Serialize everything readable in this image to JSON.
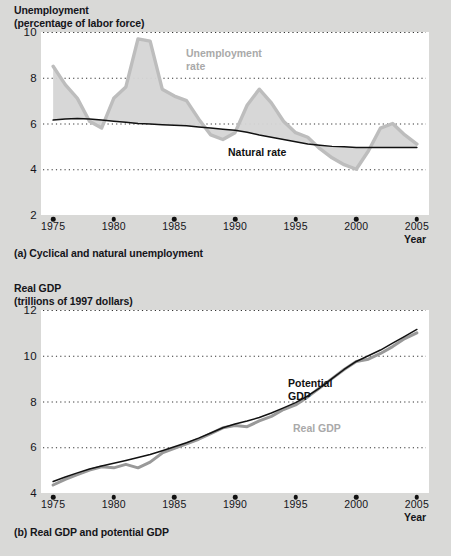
{
  "figure": {
    "background_color": "#d9d9d7",
    "plot_background_color": "#ffffff",
    "gray_series_color": "#bdbdbd",
    "black_series_color": "#111111",
    "gridline_color": "#333333"
  },
  "panel_a": {
    "axis_title_line1": "Unemployment",
    "axis_title_line2": "(percentage of labor force)",
    "caption": "(a) Cyclical and natural unemployment",
    "x_axis_label": "Year",
    "series_label_unemployment": "Unemployment\nrate",
    "series_label_natural": "Natural rate"
  },
  "panel_b": {
    "axis_title_line1": "Real GDP",
    "axis_title_line2": "(trillions of 1997 dollars)",
    "caption": "(b) Real GDP and potential GDP",
    "x_axis_label": "Year",
    "series_label_potential": "Potential\nGDP",
    "series_label_real": "Real GDP"
  },
  "chart_data": [
    {
      "type": "area",
      "panel": "a",
      "title": "Unemployment (percentage of labor force)",
      "xlabel": "Year",
      "ylabel": "Unemployment (percentage of labor force)",
      "xlim": [
        1974,
        2006
      ],
      "ylim": [
        2,
        10
      ],
      "yticks": [
        2,
        4,
        6,
        8,
        10
      ],
      "xticks": [
        1975,
        1980,
        1985,
        1990,
        1995,
        2000,
        2005
      ],
      "grid": "horizontal-dotted",
      "legend": "inline-annotations",
      "x": [
        1975,
        1976,
        1977,
        1978,
        1979,
        1980,
        1981,
        1982,
        1983,
        1984,
        1985,
        1986,
        1987,
        1988,
        1989,
        1990,
        1991,
        1992,
        1993,
        1994,
        1995,
        1996,
        1997,
        1998,
        1999,
        2000,
        2001,
        2002,
        2003,
        2004,
        2005
      ],
      "series": [
        {
          "name": "Unemployment rate",
          "color": "#bdbdbd",
          "values": [
            8.5,
            7.7,
            7.1,
            6.1,
            5.8,
            7.1,
            7.6,
            9.7,
            9.6,
            7.5,
            7.2,
            7.0,
            6.2,
            5.5,
            5.3,
            5.6,
            6.8,
            7.5,
            6.9,
            6.1,
            5.6,
            5.4,
            4.9,
            4.5,
            4.2,
            4.0,
            4.8,
            5.8,
            6.0,
            5.5,
            5.1
          ]
        },
        {
          "name": "Natural rate",
          "color": "#111111",
          "values": [
            6.15,
            6.2,
            6.22,
            6.2,
            6.15,
            6.1,
            6.05,
            6.0,
            5.98,
            5.95,
            5.92,
            5.9,
            5.85,
            5.8,
            5.75,
            5.7,
            5.62,
            5.5,
            5.4,
            5.3,
            5.2,
            5.1,
            5.05,
            5.0,
            4.98,
            4.95,
            4.95,
            4.95,
            4.95,
            4.95,
            4.95
          ]
        }
      ]
    },
    {
      "type": "line",
      "panel": "b",
      "title": "Real GDP (trillions of 1997 dollars)",
      "xlabel": "Year",
      "ylabel": "Real GDP (trillions of 1997 dollars)",
      "xlim": [
        1974,
        2006
      ],
      "ylim": [
        4,
        12
      ],
      "yticks": [
        4,
        6,
        8,
        10,
        12
      ],
      "xticks": [
        1975,
        1980,
        1985,
        1990,
        1995,
        2000,
        2005
      ],
      "grid": "horizontal-dotted",
      "legend": "inline-annotations",
      "x": [
        1975,
        1976,
        1977,
        1978,
        1979,
        1980,
        1981,
        1982,
        1983,
        1984,
        1985,
        1986,
        1987,
        1988,
        1989,
        1990,
        1991,
        1992,
        1993,
        1994,
        1995,
        1996,
        1997,
        1998,
        1999,
        2000,
        2001,
        2002,
        2003,
        2004,
        2005
      ],
      "series": [
        {
          "name": "Real GDP",
          "color": "#999999",
          "values": [
            4.35,
            4.6,
            4.8,
            5.0,
            5.15,
            5.1,
            5.25,
            5.1,
            5.35,
            5.75,
            5.95,
            6.15,
            6.35,
            6.6,
            6.85,
            6.95,
            6.9,
            7.15,
            7.35,
            7.65,
            7.85,
            8.2,
            8.6,
            9.0,
            9.4,
            9.75,
            9.85,
            10.1,
            10.4,
            10.75,
            11.0
          ]
        },
        {
          "name": "Potential GDP",
          "color": "#111111",
          "values": [
            4.5,
            4.7,
            4.88,
            5.05,
            5.18,
            5.3,
            5.42,
            5.55,
            5.68,
            5.85,
            6.02,
            6.2,
            6.4,
            6.62,
            6.85,
            7.02,
            7.15,
            7.3,
            7.5,
            7.72,
            7.95,
            8.25,
            8.6,
            9.0,
            9.4,
            9.75,
            10.0,
            10.25,
            10.55,
            10.85,
            11.15
          ]
        }
      ]
    }
  ]
}
